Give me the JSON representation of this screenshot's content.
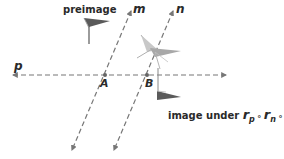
{
  "diagram": {
    "colors": {
      "line": "#777777",
      "text": "#2a2a2a",
      "flag_dark": "#5a5a5a",
      "flag_light": "#b5b5b5"
    },
    "lines": {
      "m": {
        "label": "m"
      },
      "n": {
        "label": "n"
      },
      "p": {
        "label": "p"
      }
    },
    "points": {
      "A": {
        "label": "A"
      },
      "B": {
        "label": "B"
      }
    },
    "labels": {
      "preimage": "preimage",
      "image_prefix": "image under",
      "r": "r",
      "sub_p": "p",
      "sub_n": "n",
      "sub_m": "m",
      "compose_op": "∘"
    }
  }
}
